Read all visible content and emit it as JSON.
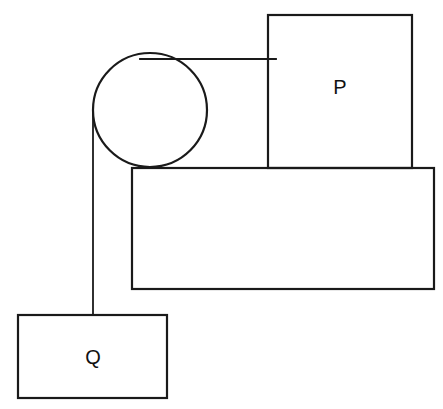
{
  "diagram": {
    "type": "pulley-system",
    "colors": {
      "stroke": "#1a1a1a",
      "background": "#ffffff"
    },
    "blocks": [
      {
        "id": "P",
        "label": "P",
        "position": "on table"
      },
      {
        "id": "Q",
        "label": "Q",
        "position": "hanging"
      }
    ],
    "table": {
      "label": ""
    },
    "pulley": {
      "label": ""
    }
  }
}
